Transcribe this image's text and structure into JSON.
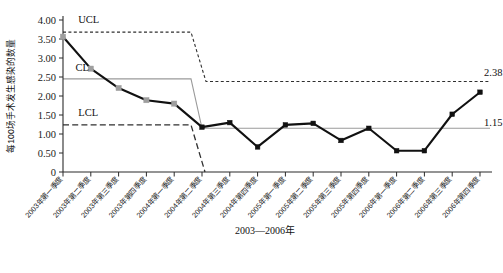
{
  "chart_data": {
    "type": "line",
    "title": "",
    "subtitle": "",
    "xlabel": "2003—2006年",
    "ylabel": "每100场手术发生感染的数量",
    "xlim": [
      0,
      15
    ],
    "ylim": [
      0,
      4.0
    ],
    "grid": false,
    "legend": "none",
    "y_ticks": [
      "0",
      "0.50",
      "1.00",
      "1.50",
      "2.00",
      "2.50",
      "3.00",
      "3.50",
      "4.00"
    ],
    "y_tick_values": [
      0,
      0.5,
      1.0,
      1.5,
      2.0,
      2.5,
      3.0,
      3.5,
      4.0
    ],
    "categories": [
      "2003年第一季度",
      "2003年第二季度",
      "2003年第三季度",
      "2003年第四季度",
      "2004年第一季度",
      "2004年第二季度",
      "2004年第三季度",
      "2004年第四季度",
      "2005年第一季度",
      "2005年第二季度",
      "2005年第三季度",
      "2005年第四季度",
      "2006年第一季度",
      "2006年第二季度",
      "2006年第三季度",
      "2006年第四季度"
    ],
    "series": [
      {
        "name": "每100场手术感染数",
        "values": [
          3.56,
          2.72,
          2.21,
          1.89,
          1.8,
          1.18,
          1.3,
          0.66,
          1.24,
          1.28,
          0.83,
          1.15,
          0.56,
          0.56,
          1.52,
          2.1
        ],
        "marker_phase1_color": "#9e9e9e",
        "marker_phase2_color": "#111111",
        "line_color": "#111111"
      }
    ],
    "control_limits": {
      "phase1": {
        "ucl": 3.68,
        "cl": 2.45,
        "lcl": 1.24,
        "from_index": 0,
        "to_index": 5
      },
      "phase2": {
        "ucl": 2.38,
        "cl": 1.15,
        "lcl": 0.0,
        "from_index": 5,
        "to_index": 15
      }
    },
    "annotations": [
      {
        "name": "ucl-label",
        "text": "UCL",
        "x_index": 0.55,
        "y": 3.92
      },
      {
        "name": "cl-label",
        "text": "CL",
        "x_index": 0.45,
        "y": 2.66
      },
      {
        "name": "lcl-label",
        "text": "LCL",
        "x_index": 0.55,
        "y": 1.47
      },
      {
        "name": "ucl2-value",
        "text": "2.38",
        "x_index": 15.1,
        "y": 2.52
      },
      {
        "name": "cl2-value",
        "text": "1.15",
        "x_index": 15.1,
        "y": 1.2
      }
    ],
    "colors": {
      "line": "#111111",
      "cl": "#9a9a9a",
      "ucl": "#2f2f2f",
      "lcl": "#2f2f2f",
      "axis": "#2b2b2b",
      "background": "#ffffff"
    }
  }
}
